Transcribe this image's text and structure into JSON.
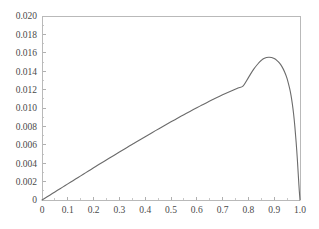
{
  "chart_data": {
    "type": "line",
    "title": "",
    "subtitle": "",
    "xlabel": "",
    "ylabel": "",
    "xlim": [
      0,
      1.0
    ],
    "ylim": [
      0,
      0.02
    ],
    "grid": false,
    "legend": null,
    "annotations": [],
    "x_tick_labels": [
      "0",
      "0.1",
      "0.2",
      "0.3",
      "0.4",
      "0.5",
      "0.6",
      "0.7",
      "0.8",
      "0.9",
      "1.0"
    ],
    "x_tick_values": [
      0,
      0.1,
      0.2,
      0.3,
      0.4,
      0.5,
      0.6,
      0.7,
      0.8,
      0.9,
      1.0
    ],
    "x_minor_ticks_between": 1,
    "y_tick_labels": [
      "0",
      "0.002",
      "0.004",
      "0.006",
      "0.008",
      "0.010",
      "0.012",
      "0.014",
      "0.016",
      "0.018",
      "0.020"
    ],
    "y_tick_values": [
      0,
      0.002,
      0.004,
      0.006,
      0.008,
      0.01,
      0.012,
      0.014,
      0.016,
      0.018,
      0.02
    ],
    "series": [
      {
        "name": "curve",
        "color": "#6b6b6b",
        "x": [
          0.0,
          0.02,
          0.04,
          0.06,
          0.08,
          0.1,
          0.12,
          0.14,
          0.16,
          0.18,
          0.2,
          0.22,
          0.24,
          0.26,
          0.28,
          0.3,
          0.32,
          0.34,
          0.36,
          0.38,
          0.4,
          0.42,
          0.44,
          0.46,
          0.48,
          0.5,
          0.52,
          0.54,
          0.56,
          0.58,
          0.6,
          0.62,
          0.64,
          0.66,
          0.68,
          0.7,
          0.72,
          0.74,
          0.76,
          0.78,
          0.8,
          0.82,
          0.84,
          0.85,
          0.86,
          0.87,
          0.88,
          0.89,
          0.9,
          0.91,
          0.92,
          0.93,
          0.94,
          0.95,
          0.96,
          0.965,
          0.97,
          0.975,
          0.98,
          0.985,
          0.99,
          0.993,
          0.995,
          0.997,
          0.999,
          1.0
        ],
        "y": [
          0.0,
          0.00035,
          0.0007,
          0.00105,
          0.0014,
          0.00175,
          0.0021,
          0.00245,
          0.0028,
          0.00315,
          0.0035,
          0.00385,
          0.00419,
          0.00453,
          0.00487,
          0.00521,
          0.00555,
          0.00589,
          0.00622,
          0.00655,
          0.00688,
          0.00721,
          0.00754,
          0.00786,
          0.00818,
          0.0085,
          0.00881,
          0.00912,
          0.00943,
          0.00973,
          0.01003,
          0.01032,
          0.01061,
          0.01089,
          0.01116,
          0.01143,
          0.01169,
          0.01194,
          0.01218,
          0.01241,
          0.0133,
          0.0142,
          0.0149,
          0.01518,
          0.01538,
          0.01549,
          0.01552,
          0.01548,
          0.01537,
          0.01518,
          0.0149,
          0.0145,
          0.01395,
          0.0132,
          0.0121,
          0.0114,
          0.0105,
          0.0094,
          0.008,
          0.0063,
          0.0043,
          0.0029,
          0.002,
          0.0011,
          0.00035,
          0.0
        ]
      }
    ],
    "peak": {
      "x": 0.88,
      "y": 0.0155
    },
    "colors": {
      "curve": "#6b6b6b",
      "frame": "#b9b9b9",
      "tick": "#b0b0b0",
      "tick_label": "#4a4a4a",
      "background": "#ffffff"
    }
  }
}
